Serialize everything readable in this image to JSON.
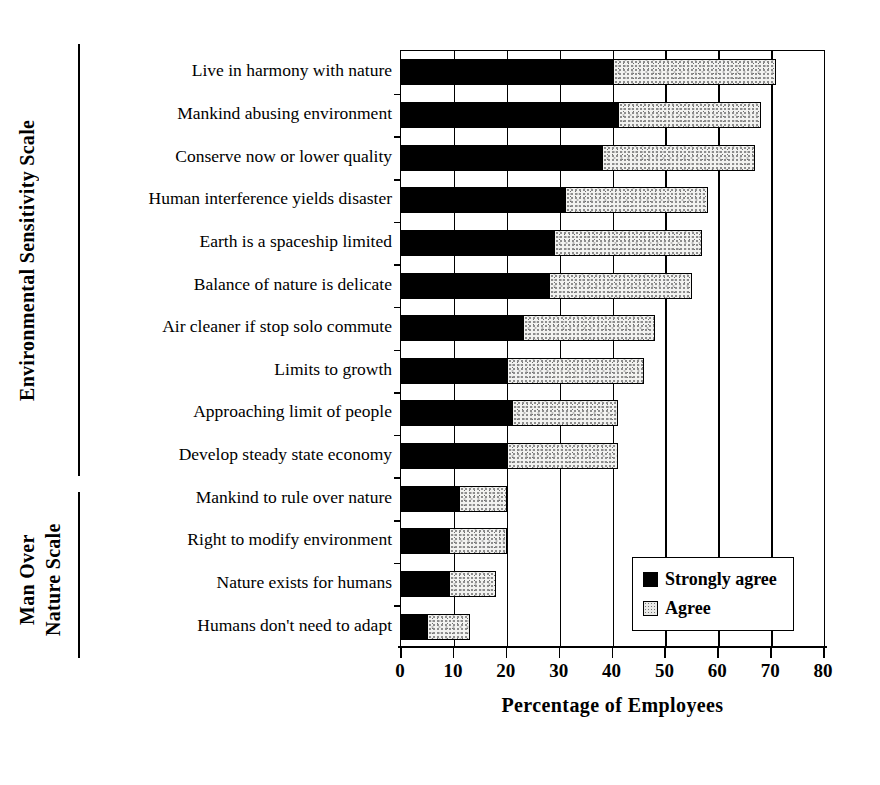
{
  "chart_data": {
    "type": "bar",
    "orientation": "horizontal",
    "stacked": true,
    "title": "",
    "xlabel": "Percentage of Employees",
    "ylabel": "",
    "xlim": [
      0,
      80
    ],
    "xticks": [
      "0",
      "10",
      "20",
      "30",
      "40",
      "50",
      "60",
      "70",
      "80"
    ],
    "xtick_values": [
      0,
      10,
      20,
      30,
      40,
      50,
      60,
      70,
      80
    ],
    "grid": "vertical",
    "legend_position": "lower right",
    "categories": [
      "Live in harmony with nature",
      "Mankind abusing environment",
      "Conserve now or lower quality",
      "Human interference yields disaster",
      "Earth is a spaceship limited",
      "Balance of nature is delicate",
      "Air cleaner if stop solo commute",
      "Limits to growth",
      "Approaching limit of people",
      "Develop steady state economy",
      "Mankind to rule over nature",
      "Right to modify environment",
      "Nature exists for humans",
      "Humans don't need to adapt"
    ],
    "series": [
      {
        "name": "Strongly agree",
        "color": "#000000",
        "values": [
          40,
          41,
          38,
          31,
          29,
          28,
          23,
          20,
          21,
          20,
          11,
          9,
          9,
          5
        ]
      },
      {
        "name": "Agree",
        "color": "#e9e9e7",
        "values": [
          31,
          27,
          29,
          27,
          28,
          27,
          25,
          26,
          20,
          21,
          9,
          11,
          9,
          8
        ]
      }
    ],
    "totals": [
      71,
      68,
      67,
      58,
      57,
      55,
      48,
      46,
      41,
      41,
      20,
      20,
      18,
      13
    ],
    "group_labels": [
      {
        "label": "Environmental Sensitivity Scale",
        "categories": 10
      },
      {
        "label": "Man Over Nature Scale",
        "categories": 4
      }
    ]
  },
  "groups": {
    "environmental": "Environmental Sensitivity Scale",
    "man_over_line1": "Man Over",
    "man_over_line2": "Nature Scale"
  },
  "legend": {
    "strongly_agree": "Strongly agree",
    "agree": "Agree"
  }
}
